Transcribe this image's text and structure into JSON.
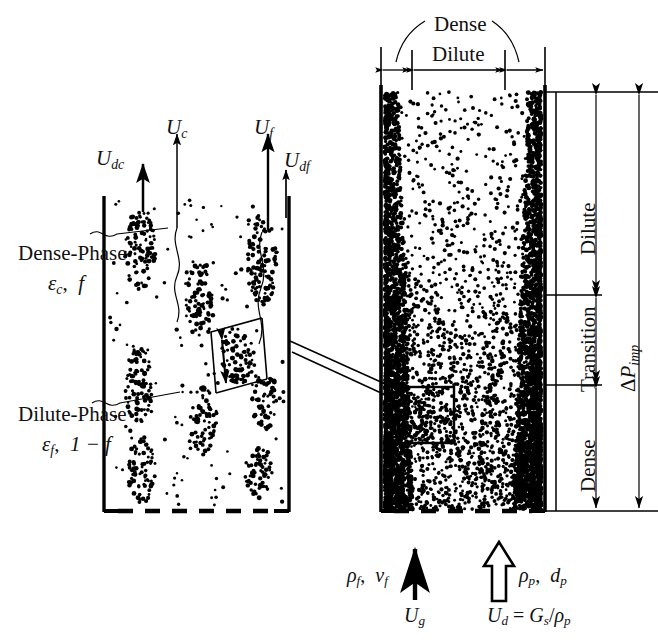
{
  "figure": {
    "type": "schematic-diagram",
    "background_color": "#ffffff",
    "ink_color": "#000000"
  },
  "left_column": {
    "name": "Left riser schematic (two-phase model)",
    "velocity_labels": [
      {
        "id": "u-dc",
        "base": "U",
        "sub": "dc",
        "x": 96,
        "y": 148
      },
      {
        "id": "u-c",
        "base": "U",
        "sub": "c",
        "x": 166,
        "y": 117
      },
      {
        "id": "u-f",
        "base": "U",
        "sub": "f",
        "x": 254,
        "y": 117
      },
      {
        "id": "u-df",
        "base": "U",
        "sub": "df",
        "x": 284,
        "y": 150
      }
    ],
    "phase_labels": [
      {
        "id": "dense-phase",
        "title": "Dense-Phase",
        "formula_a": "ε",
        "formula_a_sub": "c",
        "formula_b": "f",
        "x": 18,
        "y": 243
      },
      {
        "id": "dilute-phase",
        "title": "Dilute-Phase",
        "formula_a": "ε",
        "formula_a_sub": "f",
        "formula_b": "1 − f",
        "x": 18,
        "y": 404
      }
    ],
    "cluster_detail": {
      "id": "magnified-cluster",
      "dimension_symbol": "l"
    }
  },
  "right_column": {
    "name": "Right riser schematic (axial zones)",
    "top_dimension_labels": [
      {
        "id": "dense-top-label",
        "text": "Dense",
        "x": 434,
        "y": 18
      },
      {
        "id": "dilute-top-label",
        "text": "Dilute",
        "x": 432,
        "y": 47
      }
    ],
    "axial_zone_labels": [
      {
        "id": "zone-dilute",
        "text": "Dilute",
        "x": 573,
        "y": 235
      },
      {
        "id": "zone-transition",
        "text": "Transition",
        "x": 573,
        "y": 365
      },
      {
        "id": "zone-dense",
        "text": "Dense",
        "x": 573,
        "y": 478
      }
    ],
    "pressure_drop": {
      "id": "delta-p-imp",
      "symbol": "ΔP",
      "sub": "imp",
      "x": 622,
      "y": 370
    }
  },
  "bottom_inlets": {
    "gas": {
      "id": "gas-inlet",
      "properties_a": "ρ",
      "properties_a_sub": "f",
      "properties_b": "ν",
      "properties_b_sub": "f",
      "velocity": "U",
      "velocity_sub": "g",
      "arrow_style": "solid"
    },
    "solids": {
      "id": "solids-inlet",
      "properties_a": "ρ",
      "properties_a_sub": "p",
      "properties_b": "d",
      "properties_b_sub": "p",
      "equation_lhs": "U",
      "equation_lhs_sub": "d",
      "equation_rhs_num": "G",
      "equation_rhs_num_sub": "s",
      "equation_rhs_den": "ρ",
      "equation_rhs_den_sub": "p",
      "arrow_style": "hollow"
    }
  }
}
